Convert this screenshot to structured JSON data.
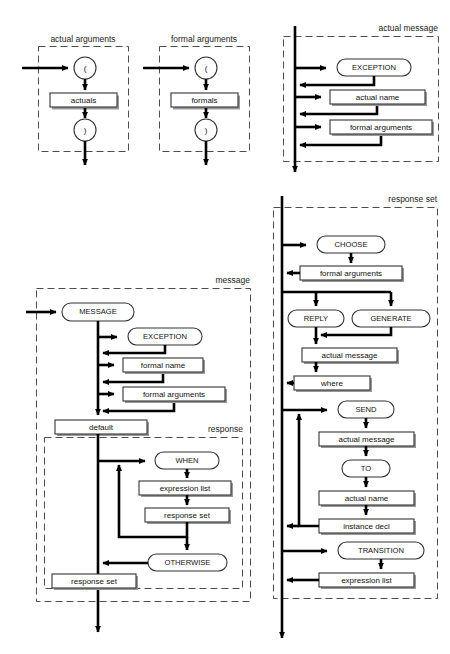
{
  "figure": {
    "background_color": "#ffffff",
    "line_color": "#000000",
    "dash_color": "#4d4d4d",
    "box_fill": "#ffffff"
  },
  "panels": [
    {
      "id": "actual-arguments",
      "label": "actual arguments",
      "nodes": [
        {
          "id": "lparen",
          "text": "(",
          "shape": "circle"
        },
        {
          "id": "actuals",
          "text": "actuals",
          "shape": "box"
        },
        {
          "id": "rparen",
          "text": ")",
          "shape": "circle"
        }
      ]
    },
    {
      "id": "formal-arguments",
      "label": "formal arguments",
      "nodes": [
        {
          "id": "lparen",
          "text": "(",
          "shape": "circle"
        },
        {
          "id": "formals",
          "text": "formals",
          "shape": "box"
        },
        {
          "id": "rparen",
          "text": ")",
          "shape": "circle"
        }
      ]
    },
    {
      "id": "actual-message",
      "label": "actual message",
      "nodes": [
        {
          "id": "exception",
          "text": "EXCEPTION",
          "shape": "rounded"
        },
        {
          "id": "actual-name",
          "text": "actual name",
          "shape": "box"
        },
        {
          "id": "formal-arguments",
          "text": "formal arguments",
          "shape": "box"
        }
      ]
    },
    {
      "id": "message",
      "label": "message",
      "nodes": [
        {
          "id": "message-kw",
          "text": "MESSAGE",
          "shape": "rounded"
        },
        {
          "id": "exception",
          "text": "EXCEPTION",
          "shape": "rounded"
        },
        {
          "id": "formal-name",
          "text": "formal name",
          "shape": "box"
        },
        {
          "id": "formal-arguments",
          "text": "formal arguments",
          "shape": "box"
        },
        {
          "id": "default",
          "text": "default",
          "shape": "box"
        },
        {
          "id": "response-set-bottom",
          "text": "response set",
          "shape": "box"
        }
      ],
      "subpanel": {
        "id": "response",
        "label": "response",
        "nodes": [
          {
            "id": "when",
            "text": "WHEN",
            "shape": "rounded"
          },
          {
            "id": "expression-list",
            "text": "expression list",
            "shape": "box"
          },
          {
            "id": "response-set",
            "text": "response set",
            "shape": "box"
          },
          {
            "id": "otherwise",
            "text": "OTHERWISE",
            "shape": "rounded"
          }
        ]
      }
    },
    {
      "id": "response-set",
      "label": "response set",
      "nodes": [
        {
          "id": "choose",
          "text": "CHOOSE",
          "shape": "rounded"
        },
        {
          "id": "formal-arguments",
          "text": "formal arguments",
          "shape": "box"
        },
        {
          "id": "reply",
          "text": "REPLY",
          "shape": "rounded"
        },
        {
          "id": "generate",
          "text": "GENERATE",
          "shape": "rounded"
        },
        {
          "id": "actual-message-1",
          "text": "actual message",
          "shape": "box"
        },
        {
          "id": "where",
          "text": "where",
          "shape": "box"
        },
        {
          "id": "send",
          "text": "SEND",
          "shape": "rounded"
        },
        {
          "id": "actual-message-2",
          "text": "actual message",
          "shape": "box"
        },
        {
          "id": "to",
          "text": "TO",
          "shape": "rounded"
        },
        {
          "id": "actual-name",
          "text": "actual name",
          "shape": "box"
        },
        {
          "id": "instance-decl",
          "text": "instance decl",
          "shape": "box"
        },
        {
          "id": "transition",
          "text": "TRANSITION",
          "shape": "rounded"
        },
        {
          "id": "expression-list",
          "text": "expression list",
          "shape": "box"
        }
      ]
    }
  ]
}
